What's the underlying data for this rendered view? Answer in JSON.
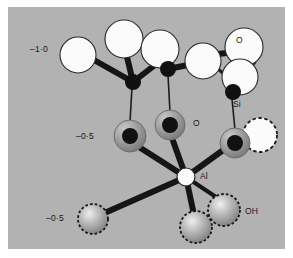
{
  "figure": {
    "kind": "molecular-structure-diagram",
    "background_color": "#b2b2b2",
    "page_color": "#ffffff",
    "width": 293,
    "height": 258
  },
  "palette": {
    "background": "#b2b2b2",
    "oxygen_white": "#fbfbfb",
    "silicon_black": "#101010",
    "bridging_oxygen_gray": "#9a9a9a",
    "bridging_oxygen_core": "#111111",
    "hydroxyl_sphere": "#a8a8a8",
    "bond_dark": "#151515",
    "outline": "#2a2a2a",
    "text": "#16161a"
  },
  "labels": [
    {
      "id": "charge-minus-one",
      "text": "–1·0",
      "x": 22,
      "y": 38,
      "size": "normal"
    },
    {
      "id": "oxygen-top-right",
      "text": "O",
      "x": 228,
      "y": 29,
      "size": "normal"
    },
    {
      "id": "silicon",
      "text": "Si",
      "x": 225,
      "y": 93,
      "size": "normal"
    },
    {
      "id": "oxygen-middle",
      "text": "O",
      "x": 155,
      "y": 114,
      "size": "normal"
    },
    {
      "id": "charge-minus-half-upper",
      "text": "–0·5",
      "x": 76,
      "y": 126,
      "size": "normal"
    },
    {
      "id": "aluminium",
      "text": "Al",
      "x": 182,
      "y": 168,
      "size": "normal"
    },
    {
      "id": "charge-minus-half-lower",
      "text": "–0·5",
      "x": 46,
      "y": 206,
      "size": "normal"
    },
    {
      "id": "hydroxyl",
      "text": "OH",
      "x": 232,
      "y": 206,
      "size": "normal"
    }
  ],
  "atoms": {
    "oxygen_white": [
      {
        "id": "o-left-outer",
        "cx": 70,
        "cy": 48,
        "r": 18
      },
      {
        "id": "o-top-left",
        "cx": 116,
        "cy": 32,
        "r": 19
      },
      {
        "id": "o-top-mid",
        "cx": 152,
        "cy": 42,
        "r": 19
      },
      {
        "id": "o-top-centre",
        "cx": 195,
        "cy": 54,
        "r": 18
      },
      {
        "id": "o-top-right-upper",
        "cx": 236,
        "cy": 40,
        "r": 19
      },
      {
        "id": "o-top-right-lower",
        "cx": 232,
        "cy": 70,
        "r": 18
      }
    ],
    "silicon_black": [
      {
        "id": "si-left",
        "cx": 125,
        "cy": 75,
        "r": 8
      },
      {
        "id": "si-mid",
        "cx": 160,
        "cy": 62,
        "r": 8
      },
      {
        "id": "si-right",
        "cx": 225,
        "cy": 85,
        "r": 8
      }
    ],
    "bridging_oxygen": [
      {
        "id": "ob-left",
        "cx": 122,
        "cy": 129,
        "r": 16
      },
      {
        "id": "ob-mid",
        "cx": 162,
        "cy": 118,
        "r": 15
      },
      {
        "id": "ob-right",
        "cx": 227,
        "cy": 136,
        "r": 15
      }
    ],
    "aluminium": {
      "id": "al-centre",
      "cx": 178,
      "cy": 170,
      "r": 9
    },
    "hydroxyl_spheres": [
      {
        "id": "oh-left",
        "cx": 85,
        "cy": 212,
        "r": 15
      },
      {
        "id": "oh-mid",
        "cx": 188,
        "cy": 220,
        "r": 16
      },
      {
        "id": "oh-right",
        "cx": 216,
        "cy": 203,
        "r": 16
      }
    ],
    "dashed_white": {
      "id": "o-dashed-right",
      "cx": 252,
      "cy": 128,
      "r": 17
    }
  },
  "bonds": {
    "thick": [
      {
        "id": "bond-o-left-outer-si-left",
        "x1": 86,
        "y1": 53,
        "x2": 125,
        "y2": 75
      },
      {
        "id": "bond-o-top-left-si-left",
        "x1": 119,
        "y1": 50,
        "x2": 125,
        "y2": 75
      },
      {
        "id": "bond-o-top-mid-si-left",
        "x1": 147,
        "y1": 58,
        "x2": 125,
        "y2": 75
      },
      {
        "id": "bond-o-top-mid-si-mid",
        "x1": 157,
        "y1": 56,
        "x2": 160,
        "y2": 62
      },
      {
        "id": "bond-o-top-centre-si-mid",
        "x1": 178,
        "y1": 57,
        "x2": 160,
        "y2": 62
      },
      {
        "id": "bond-o-top-right-upper-o-top-centre",
        "x1": 218,
        "y1": 45,
        "x2": 199,
        "y2": 46
      },
      {
        "id": "bond-o-top-right-lower-si-right",
        "x1": 229,
        "y1": 80,
        "x2": 225,
        "y2": 85
      },
      {
        "id": "bond-si-right-stub",
        "x1": 228,
        "y1": 84,
        "x2": 247,
        "y2": 70
      },
      {
        "id": "bond-al-ob-left",
        "x1": 178,
        "y1": 170,
        "x2": 131,
        "y2": 140
      },
      {
        "id": "bond-al-ob-mid",
        "x1": 178,
        "y1": 170,
        "x2": 164,
        "y2": 131
      },
      {
        "id": "bond-al-ob-right",
        "x1": 178,
        "y1": 170,
        "x2": 218,
        "y2": 141
      },
      {
        "id": "bond-al-oh-left",
        "x1": 178,
        "y1": 170,
        "x2": 92,
        "y2": 208
      },
      {
        "id": "bond-al-oh-mid",
        "x1": 178,
        "y1": 170,
        "x2": 186,
        "y2": 208
      },
      {
        "id": "bond-al-oh-right",
        "x1": 178,
        "y1": 170,
        "x2": 211,
        "y2": 192
      }
    ],
    "thin": [
      {
        "id": "bond-si-left-ob-left",
        "x1": 124,
        "y1": 80,
        "x2": 122,
        "y2": 115
      },
      {
        "id": "bond-si-mid-ob-mid",
        "x1": 160,
        "y1": 68,
        "x2": 162,
        "y2": 105
      },
      {
        "id": "bond-si-right-ob-right",
        "x1": 224,
        "y1": 92,
        "x2": 227,
        "y2": 123
      },
      {
        "id": "bond-ob-right-o-dashed",
        "x1": 236,
        "y1": 133,
        "x2": 248,
        "y2": 128
      },
      {
        "id": "bond-o-top-right-upper-lower",
        "x1": 246,
        "y1": 55,
        "x2": 243,
        "y2": 60
      },
      {
        "id": "bond-o-top-centre-o-top-right-lower",
        "x1": 211,
        "y1": 61,
        "x2": 216,
        "y2": 66
      }
    ]
  }
}
